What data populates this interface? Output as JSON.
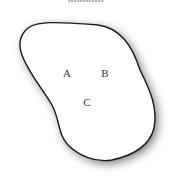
{
  "diagram": {
    "type": "region-with-points",
    "points": [
      {
        "label": "A",
        "x": 67,
        "y": 73
      },
      {
        "label": "B",
        "x": 105,
        "y": 73
      },
      {
        "label": "C",
        "x": 87,
        "y": 102
      }
    ],
    "colors": {
      "outline": "#1a1a1a",
      "fill": "#ffffff",
      "shadow": "#808080"
    }
  }
}
